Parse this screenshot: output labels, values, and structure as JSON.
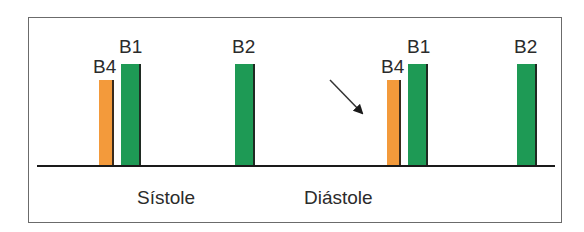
{
  "diagram": {
    "title": "",
    "colors": {
      "b4": "#f39a3b",
      "b1": "#1e9a55",
      "b2": "#1e9a55",
      "baseline": "#1a1a1a",
      "frame": "#6b6b6b"
    },
    "cycles": [
      {
        "sounds": [
          {
            "label": "B4",
            "color": "orange"
          },
          {
            "label": "B1",
            "color": "green"
          },
          {
            "label": "B2",
            "color": "green"
          }
        ]
      },
      {
        "sounds": [
          {
            "label": "B4",
            "color": "orange"
          },
          {
            "label": "B1",
            "color": "green"
          },
          {
            "label": "B2",
            "color": "green"
          }
        ]
      }
    ],
    "phases": {
      "systole": "Sístole",
      "diastole": "Diástole"
    },
    "arrow": {
      "direction": "down-right",
      "points_to": "B4"
    }
  }
}
